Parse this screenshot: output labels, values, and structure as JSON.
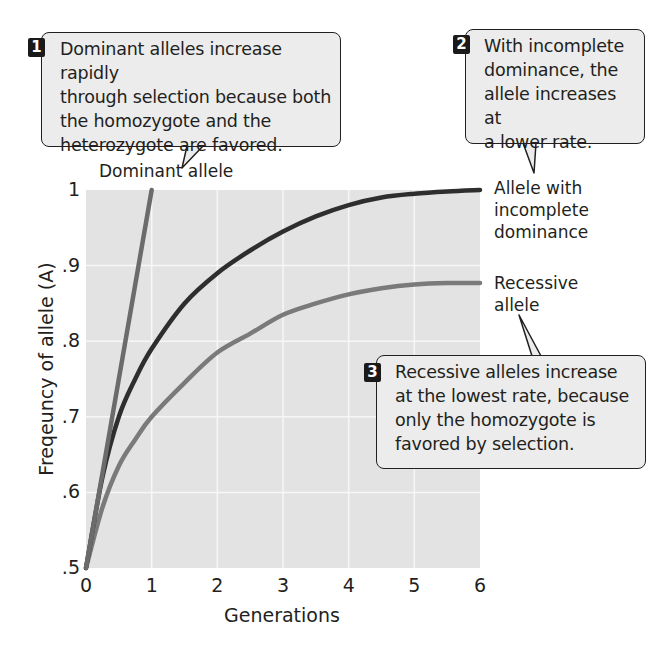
{
  "chart_data": {
    "type": "line",
    "title": "",
    "xlabel": "Generations",
    "ylabel": "Freqeuncy of allele (A)",
    "xlim": [
      0,
      6
    ],
    "ylim": [
      0.5,
      1
    ],
    "x_ticks": [
      "0",
      "1",
      "2",
      "3",
      "4",
      "5",
      "6"
    ],
    "y_ticks": [
      ".5",
      ".6",
      ".7",
      ".8",
      ".9",
      "1"
    ],
    "grid": true,
    "series": [
      {
        "name": "Dominant allele",
        "color": "#6b6b6b",
        "x": [
          0,
          1
        ],
        "values": [
          0.5,
          1.0
        ]
      },
      {
        "name": "Allele with incomplete dominance",
        "color": "#2e2e2e",
        "x": [
          0,
          0.25,
          0.5,
          0.75,
          1,
          1.5,
          2,
          2.5,
          3,
          3.5,
          4,
          4.5,
          5,
          5.5,
          6
        ],
        "values": [
          0.5,
          0.62,
          0.7,
          0.75,
          0.79,
          0.85,
          0.89,
          0.92,
          0.945,
          0.965,
          0.98,
          0.99,
          0.995,
          0.998,
          1.0
        ]
      },
      {
        "name": "Recessive allele",
        "color": "#7a7a7a",
        "x": [
          0,
          0.25,
          0.5,
          0.75,
          1,
          1.5,
          2,
          2.5,
          3,
          3.5,
          4,
          4.5,
          5,
          5.5,
          6
        ],
        "values": [
          0.5,
          0.58,
          0.635,
          0.67,
          0.7,
          0.745,
          0.785,
          0.81,
          0.835,
          0.85,
          0.862,
          0.87,
          0.875,
          0.877,
          0.877
        ]
      }
    ],
    "annotations": [
      {
        "number": "1",
        "text": "Dominant alleles increase rapidly through selection because both the homozygote and the heterozygote are favored.",
        "points_to": "Dominant allele"
      },
      {
        "number": "2",
        "text": "With incomplete dominance, the allele increases at a lower rate.",
        "points_to": "Allele with incomplete dominance"
      },
      {
        "number": "3",
        "text": "Recessive alleles increase at the lowest rate, because only the homozygote is favored by selection.",
        "points_to": "Recessive allele"
      }
    ]
  },
  "callouts": [
    {
      "number": "1",
      "lines": [
        "Dominant alleles increase rapidly",
        "through selection because both",
        "the homozygote and the",
        "heterozygote are favored."
      ]
    },
    {
      "number": "2",
      "lines": [
        "With incomplete",
        "dominance, the",
        "allele increases at",
        "a lower rate."
      ]
    },
    {
      "number": "3",
      "lines": [
        "Recessive alleles increase",
        "at the lowest rate, because",
        "only the homozygote is",
        "favored by selection."
      ]
    }
  ],
  "series_labels": {
    "dominant": [
      "Dominant allele"
    ],
    "incomplete": [
      "Allele with",
      "incomplete",
      "dominance"
    ],
    "recessive": [
      "Recessive",
      "allele"
    ]
  },
  "colors": {
    "plot_bg": "#e3e3e3",
    "grid": "#f7f7f7",
    "callout_bg": "#ececec",
    "text": "#231f20"
  }
}
